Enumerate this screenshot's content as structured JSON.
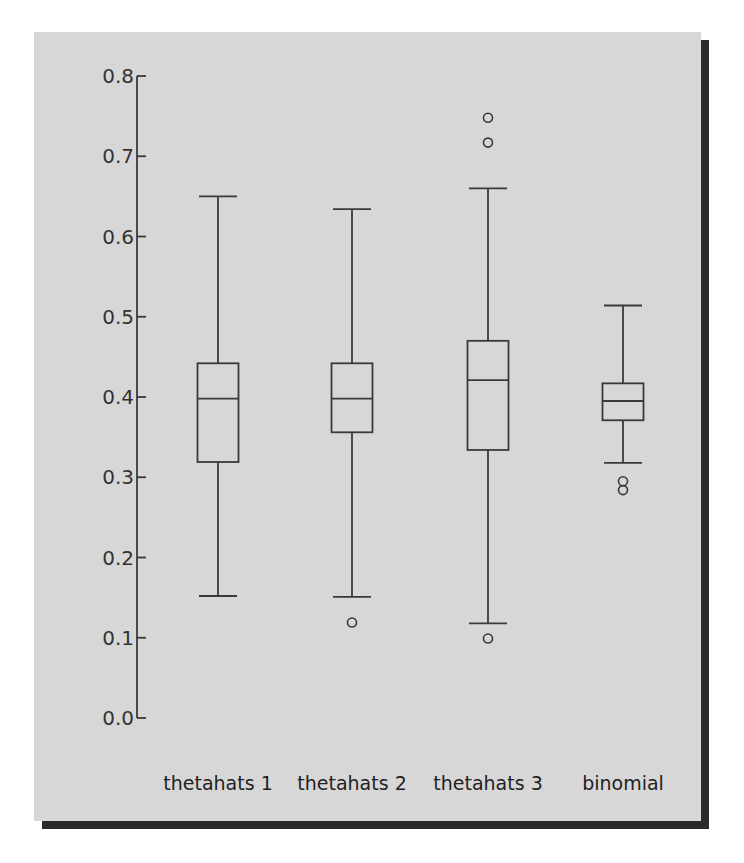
{
  "chart_data": {
    "type": "boxplot",
    "title": "",
    "xlabel": "",
    "ylabel": "",
    "ylim": [
      0.0,
      0.8
    ],
    "yticks": [
      0.0,
      0.1,
      0.2,
      0.3,
      0.4,
      0.5,
      0.6,
      0.7,
      0.8
    ],
    "ytick_labels": [
      "0.0",
      "0.1",
      "0.2",
      "0.3",
      "0.4",
      "0.5",
      "0.6",
      "0.7",
      "0.8"
    ],
    "grid": false,
    "legend": null,
    "categories": [
      "thetahats 1",
      "thetahats 2",
      "thetahats 3",
      "binomial"
    ],
    "series": [
      {
        "name": "thetahats 1",
        "whisker_low": 0.152,
        "q1": 0.319,
        "median": 0.398,
        "q3": 0.442,
        "whisker_high": 0.65,
        "outliers": []
      },
      {
        "name": "thetahats 2",
        "whisker_low": 0.151,
        "q1": 0.356,
        "median": 0.398,
        "q3": 0.442,
        "whisker_high": 0.634,
        "outliers": [
          0.119
        ]
      },
      {
        "name": "thetahats 3",
        "whisker_low": 0.118,
        "q1": 0.334,
        "median": 0.421,
        "q3": 0.47,
        "whisker_high": 0.66,
        "outliers": [
          0.099,
          0.717,
          0.748
        ]
      },
      {
        "name": "binomial",
        "whisker_low": 0.318,
        "q1": 0.371,
        "median": 0.395,
        "q3": 0.417,
        "whisker_high": 0.514,
        "outliers": [
          0.284,
          0.295
        ]
      }
    ]
  }
}
